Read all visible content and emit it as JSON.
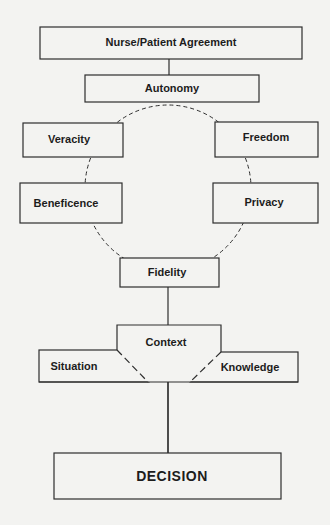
{
  "diagram": {
    "title": "Nurse/Patient Agreement",
    "nodes": {
      "agreement": {
        "label": "Nurse/Patient Agreement"
      },
      "autonomy": {
        "label": "Autonomy"
      },
      "veracity": {
        "label": "Veracity"
      },
      "freedom": {
        "label": "Freedom"
      },
      "beneficence": {
        "label": "Beneficence"
      },
      "privacy": {
        "label": "Privacy"
      },
      "fidelity": {
        "label": "Fidelity"
      },
      "context": {
        "label": "Context"
      },
      "situation": {
        "label": "Situation"
      },
      "knowledge": {
        "label": "Knowledge"
      },
      "decision": {
        "label": "DECISION"
      }
    },
    "edges": [
      {
        "from": "Nurse/Patient Agreement",
        "to": "Autonomy",
        "style": "solid"
      },
      {
        "from": "Autonomy",
        "to": "Veracity",
        "style": "dashed-arc"
      },
      {
        "from": "Autonomy",
        "to": "Freedom",
        "style": "dashed-arc"
      },
      {
        "from": "Veracity",
        "to": "Beneficence",
        "style": "dashed-arc"
      },
      {
        "from": "Freedom",
        "to": "Privacy",
        "style": "dashed-arc"
      },
      {
        "from": "Beneficence",
        "to": "Fidelity",
        "style": "dashed-arc"
      },
      {
        "from": "Privacy",
        "to": "Fidelity",
        "style": "dashed-arc"
      },
      {
        "from": "Fidelity",
        "to": "Context",
        "style": "solid"
      },
      {
        "from": "Context",
        "to": "Situation",
        "style": "dashed"
      },
      {
        "from": "Context",
        "to": "Knowledge",
        "style": "dashed"
      },
      {
        "from": "Context",
        "to": "DECISION",
        "style": "solid"
      }
    ],
    "colors": {
      "background": "#f3f3f1",
      "line": "#2e2e2e",
      "text": "#1c1c1c"
    }
  }
}
